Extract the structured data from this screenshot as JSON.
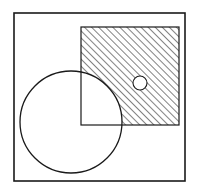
{
  "diagram": {
    "colors": {
      "background": "#ffffff",
      "stroke": "#1a1a1a",
      "hatch": "#1a1a1a"
    },
    "universe": {
      "x": 14,
      "y": 13,
      "width": 171,
      "height": 168
    },
    "square_set": {
      "x": 81,
      "y": 27,
      "width": 98,
      "height": 98
    },
    "large_circle": {
      "cx": 71,
      "cy": 122,
      "r": 51
    },
    "small_circle": {
      "cx": 140,
      "cy": 83,
      "r": 7
    },
    "hatch": {
      "region": "square minus large circle minus small circle",
      "direction": "diagonal lower-left to upper-right",
      "spacing": 5
    }
  }
}
